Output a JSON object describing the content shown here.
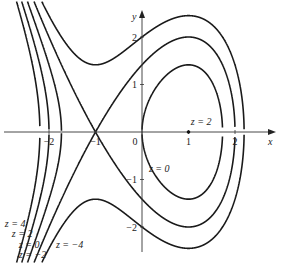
{
  "chart_data": {
    "type": "contour",
    "function": "z = 3x - x^3 - y^2",
    "xlabel": "x",
    "ylabel": "y",
    "xlim": [
      -3.05,
      2.9
    ],
    "ylim": [
      -2.9,
      2.85
    ],
    "x_ticks": [
      {
        "v": -2,
        "label": "−2"
      },
      {
        "v": -1,
        "label": "−1"
      },
      {
        "v": 0,
        "label": "0"
      },
      {
        "v": 1,
        "label": "1"
      },
      {
        "v": 2,
        "label": "2"
      }
    ],
    "y_ticks": [
      {
        "v": 2,
        "label": "2"
      },
      {
        "v": 1,
        "label": "1"
      },
      {
        "v": -1,
        "label": "−1"
      },
      {
        "v": -2,
        "label": "−2"
      }
    ],
    "levels": [
      4,
      2,
      0,
      -2,
      -4
    ],
    "annotations": [
      {
        "text": "z = 2",
        "x": 1.05,
        "y": 0.15,
        "marks_point": [
          1,
          0
        ]
      },
      {
        "text": "z = 0",
        "x": 0.15,
        "y": -0.85
      },
      {
        "text": "z = 4",
        "x": -2.95,
        "y": -2.0
      },
      {
        "text": "z = 2",
        "x": -2.8,
        "y": -2.2
      },
      {
        "text": "z = 0",
        "x": -2.65,
        "y": -2.45
      },
      {
        "text": "z = −2",
        "x": -2.65,
        "y": -2.65
      },
      {
        "text": "z = −4",
        "x": -1.85,
        "y": -2.45
      }
    ],
    "grid": false
  },
  "axis_labels": {
    "x": "x",
    "y": "y"
  }
}
